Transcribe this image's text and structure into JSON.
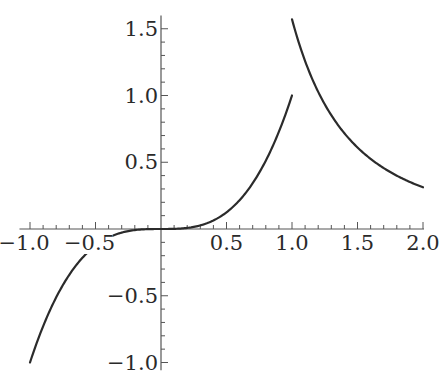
{
  "chart_data": {
    "type": "line",
    "title": "",
    "xlabel": "",
    "ylabel": "",
    "xlim": [
      -1.05,
      2.0
    ],
    "ylim": [
      -1.05,
      1.6
    ],
    "grid": false,
    "legend": null,
    "x_ticks": [
      -1.0,
      -0.5,
      0.5,
      1.0,
      1.5,
      2.0
    ],
    "x_tick_labels": [
      "−1.0",
      "−0.5",
      "0.5",
      "1.0",
      "1.5",
      "2.0"
    ],
    "y_ticks": [
      -1.0,
      -0.5,
      0.5,
      1.0,
      1.5
    ],
    "y_tick_labels": [
      "−1.0",
      "−0.5",
      "0.5",
      "1.0",
      "1.5"
    ],
    "minor_tick_step": 0.1,
    "series": [
      {
        "name": "segment-1",
        "description": "cubic x^3 on [-1, 1]",
        "x": [
          -1.0,
          -0.9,
          -0.8,
          -0.7,
          -0.6,
          -0.5,
          -0.4,
          -0.3,
          -0.2,
          -0.1,
          0.0,
          0.1,
          0.2,
          0.3,
          0.4,
          0.5,
          0.6,
          0.7,
          0.8,
          0.9,
          1.0
        ],
        "y": [
          -1.0,
          -0.729,
          -0.512,
          -0.343,
          -0.216,
          -0.125,
          -0.064,
          -0.027,
          -0.008,
          -0.001,
          0.0,
          0.001,
          0.008,
          0.027,
          0.064,
          0.125,
          0.216,
          0.343,
          0.512,
          0.729,
          1.0
        ]
      },
      {
        "name": "segment-2",
        "description": "decreasing curve on [1, 2], approx 1.57*x^-2.33",
        "x": [
          1.0,
          1.1,
          1.2,
          1.3,
          1.4,
          1.5,
          1.6,
          1.7,
          1.8,
          1.9,
          2.0
        ],
        "y": [
          1.57,
          1.258,
          1.025,
          0.848,
          0.71,
          0.61,
          0.526,
          0.457,
          0.4,
          0.352,
          0.31
        ]
      }
    ]
  },
  "layout": {
    "origin_px": [
      161,
      229
    ],
    "x_scale_px": 131,
    "y_scale_px": 133.5,
    "curve_color": "#2b2b2b",
    "axis_color": "#555555"
  }
}
